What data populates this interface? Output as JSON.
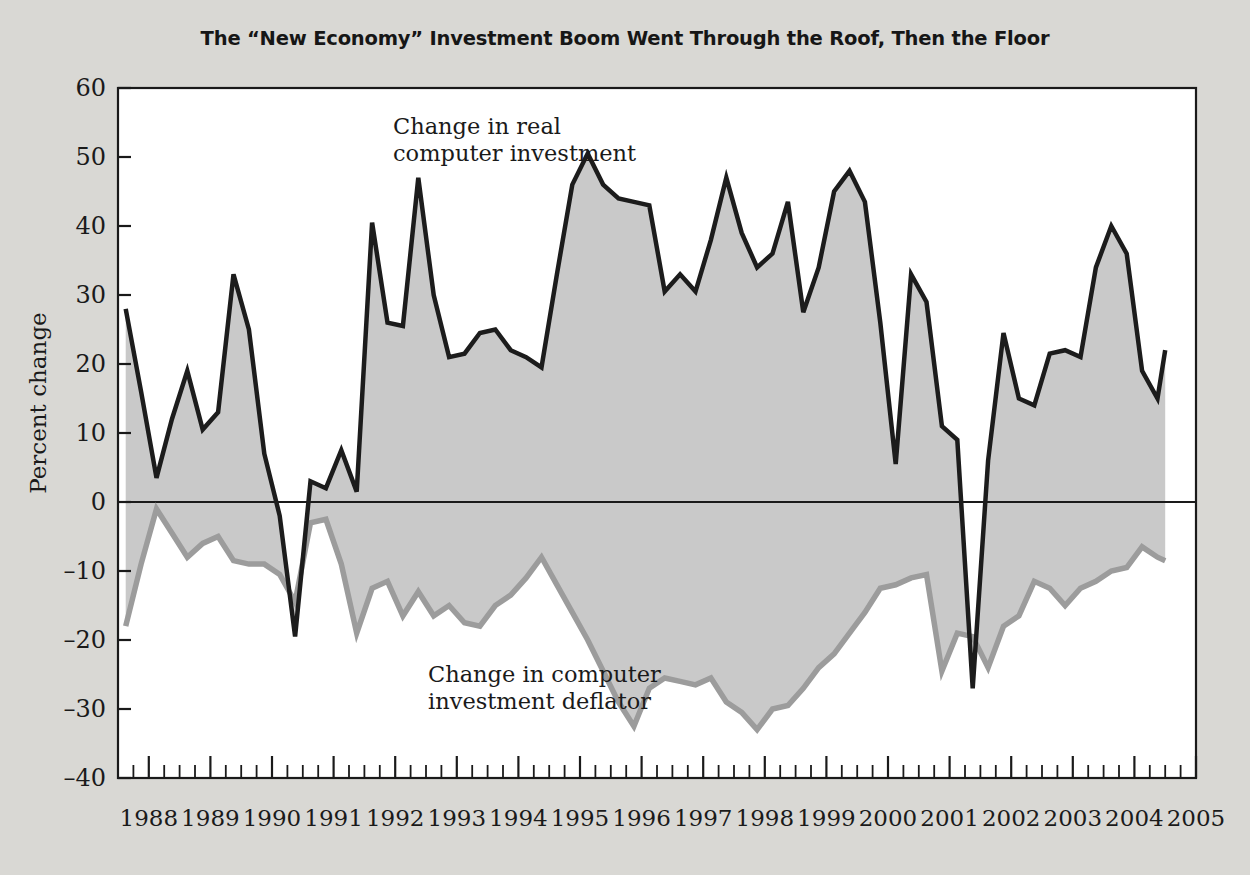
{
  "chart_data": {
    "type": "line",
    "title": "The “New Economy” Investment Boom Went Through the Roof, Then the Floor",
    "xlabel": "",
    "ylabel": "Percent change",
    "ylim": [
      -40,
      60
    ],
    "xlim": [
      1987.5,
      2005.0
    ],
    "yticks": [
      60,
      50,
      40,
      30,
      20,
      10,
      0,
      -10,
      -20,
      -30,
      -40
    ],
    "ytick_labels": [
      "60",
      "50",
      "40",
      "30",
      "20",
      "10",
      "0",
      "–10",
      "–20",
      "–30",
      "–40"
    ],
    "xticks": [
      1988,
      1989,
      1990,
      1991,
      1992,
      1993,
      1994,
      1995,
      1996,
      1997,
      1998,
      1999,
      2000,
      2001,
      2002,
      2003,
      2004,
      2005
    ],
    "xtick_labels": [
      "1988",
      "1989",
      "1990",
      "1991",
      "1992",
      "1993",
      "1994",
      "1995",
      "1996",
      "1997",
      "1998",
      "1999",
      "2000",
      "2001",
      "2002",
      "2003",
      "2004",
      "2005"
    ],
    "minor_ticks_per_year": 4,
    "grid": false,
    "legend": "annotations-inline",
    "zero_line": 0,
    "fill_between_series": true,
    "fill_color": "#c9c9c9",
    "plot_bg": "#ffffff",
    "page_bg": "#d9d8d4",
    "annotations": [
      {
        "name": "series-label-investment",
        "text_line1": "Change in real",
        "text_line2": "computer investment",
        "x": 1994.4,
        "y": 53
      },
      {
        "name": "series-label-deflator",
        "text_line1": "Change in computer",
        "text_line2": "investment deflator",
        "x": 1996.2,
        "y": -25
      }
    ],
    "x": [
      1987.625,
      1987.875,
      1988.125,
      1988.375,
      1988.625,
      1988.875,
      1989.125,
      1989.375,
      1989.625,
      1989.875,
      1990.125,
      1990.375,
      1990.625,
      1990.875,
      1991.125,
      1991.375,
      1991.625,
      1991.875,
      1992.125,
      1992.375,
      1992.625,
      1992.875,
      1993.125,
      1993.375,
      1993.625,
      1993.875,
      1994.125,
      1994.375,
      1994.625,
      1994.875,
      1995.125,
      1995.375,
      1995.625,
      1995.875,
      1996.125,
      1996.375,
      1996.625,
      1996.875,
      1997.125,
      1997.375,
      1997.625,
      1997.875,
      1998.125,
      1998.375,
      1998.625,
      1998.875,
      1999.125,
      1999.375,
      1999.625,
      1999.875,
      2000.125,
      2000.375,
      2000.625,
      2000.875,
      2001.125,
      2001.375,
      2001.625,
      2001.875,
      2002.125,
      2002.375,
      2002.625,
      2002.875,
      2003.125,
      2003.375,
      2003.625,
      2003.875,
      2004.125,
      2004.375,
      2004.5
    ],
    "series": [
      {
        "name": "Change in real computer investment",
        "color": "#1c1c1c",
        "linewidth": 4.5,
        "values": [
          28,
          16,
          3.5,
          12,
          19,
          10.5,
          13,
          33,
          25,
          7,
          -2,
          -19.5,
          3,
          2,
          7.5,
          1.5,
          40.5,
          26,
          25.5,
          47,
          30,
          21,
          21.5,
          24.5,
          25,
          22,
          21,
          19.5,
          33,
          46,
          50.5,
          46,
          44,
          43.5,
          43,
          30.5,
          33,
          30.5,
          38,
          47,
          39,
          34,
          36,
          43.5,
          27.5,
          34,
          45,
          48,
          43.5,
          26,
          5.5,
          33,
          29,
          11,
          9,
          -27,
          6,
          24.5,
          15,
          14,
          21.5,
          22,
          21,
          34,
          40,
          36,
          19,
          15,
          22
        ]
      },
      {
        "name": "Change in computer investment deflator",
        "color": "#9c9c9c",
        "linewidth": 5.5,
        "values": [
          -18,
          -9,
          -1,
          -4.5,
          -8,
          -6,
          -5,
          -8.5,
          -9,
          -9,
          -10.5,
          -14.5,
          -3,
          -2.5,
          -9,
          -19,
          -12.5,
          -11.5,
          -16.5,
          -13,
          -16.5,
          -15,
          -17.5,
          -18,
          -15,
          -13.5,
          -11,
          -8,
          -12,
          -16,
          -20,
          -24.5,
          -29,
          -32.5,
          -27,
          -25.5,
          -26,
          -26.5,
          -25.5,
          -29,
          -30.5,
          -33,
          -30,
          -29.5,
          -27,
          -24,
          -22,
          -19,
          -16,
          -12.5,
          -12,
          -11,
          -10.5,
          -24.5,
          -19,
          -19.5,
          -24,
          -18,
          -16.5,
          -11.5,
          -12.5,
          -15,
          -12.5,
          -11.5,
          -10,
          -9.5,
          -6.5,
          -8,
          -8.5
        ]
      }
    ]
  }
}
